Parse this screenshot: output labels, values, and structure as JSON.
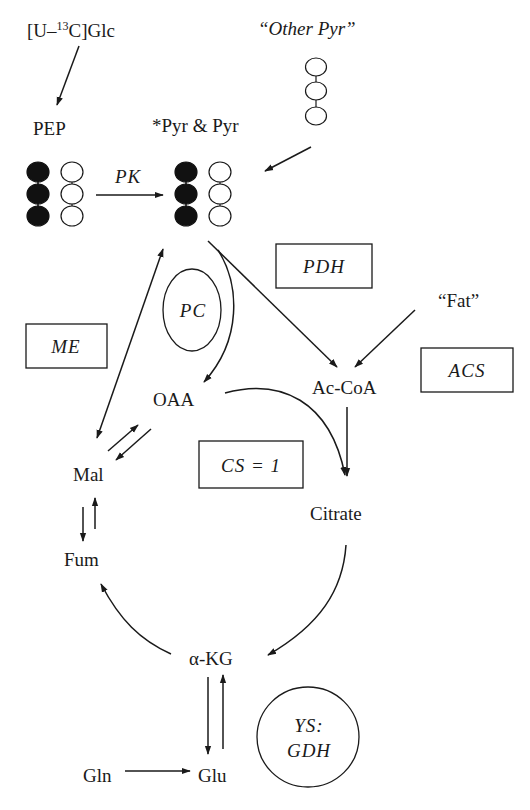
{
  "diagram": {
    "type": "metabolic-pathway",
    "metabolites": {
      "glc_label": "[U–",
      "glc_isotope": "13",
      "glc_rest": "C]Glc",
      "other_pyr": "“Other Pyr”",
      "pep": "PEP",
      "pyr": "*Pyr & Pyr",
      "fat": "“Fat”",
      "oaa": "OAA",
      "accoa": "Ac-CoA",
      "mal": "Mal",
      "citrate": "Citrate",
      "fum": "Fum",
      "akg": "α-KG",
      "gln": "Gln",
      "glu": "Glu"
    },
    "enzymes": {
      "pk": "PK",
      "pdh": "PDH",
      "pc": "PC",
      "me": "ME",
      "acs": "ACS",
      "cs": "CS = 1",
      "ys_line1": "YS:",
      "ys_line2": "GDH"
    },
    "carbon_chains": [
      {
        "id": "pep-labeled",
        "carbons": 3,
        "labeled": true
      },
      {
        "id": "pep-unlabeled",
        "carbons": 3,
        "labeled": false
      },
      {
        "id": "pyr-labeled",
        "carbons": 3,
        "labeled": true
      },
      {
        "id": "pyr-unlabeled",
        "carbons": 3,
        "labeled": false
      },
      {
        "id": "other-pyr",
        "carbons": 3,
        "labeled": false
      }
    ],
    "edges": [
      {
        "from": "[U-13C]Glc",
        "to": "PEP"
      },
      {
        "from": "PEP",
        "to": "*Pyr & Pyr",
        "enzyme": "PK"
      },
      {
        "from": "Other Pyr",
        "to": "*Pyr & Pyr"
      },
      {
        "from": "*Pyr & Pyr",
        "to": "OAA",
        "enzyme": "PC"
      },
      {
        "from": "*Pyr & Pyr",
        "to": "Ac-CoA",
        "enzyme": "PDH"
      },
      {
        "from": "Fat",
        "to": "Ac-CoA",
        "enzyme": "ACS"
      },
      {
        "from": "Mal",
        "to": "*Pyr & Pyr",
        "enzyme": "ME",
        "bidirectional": true
      },
      {
        "from": "OAA",
        "to": "Mal",
        "reversible": true
      },
      {
        "from": "OAA",
        "to": "Citrate",
        "enzyme": "CS = 1"
      },
      {
        "from": "Ac-CoA",
        "to": "Citrate"
      },
      {
        "from": "Citrate",
        "to": "α-KG"
      },
      {
        "from": "α-KG",
        "to": "Fum"
      },
      {
        "from": "Fum",
        "to": "Mal",
        "reversible": true
      },
      {
        "from": "α-KG",
        "to": "Glu",
        "reversible": true,
        "enzyme": "YS: GDH"
      },
      {
        "from": "Gln",
        "to": "Glu"
      }
    ],
    "colors": {
      "ink": "#1a1a1a",
      "labeled_carbon": "#111111",
      "background": "#ffffff"
    }
  }
}
